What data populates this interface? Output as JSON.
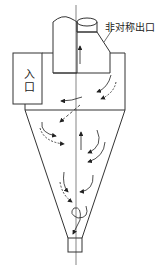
{
  "diagram": {
    "labels": {
      "inlet": "入口",
      "asymmetric_outlet": "非对称出口"
    },
    "components": [
      "inlet",
      "cylinder-body",
      "outlet-pipe",
      "asymmetric-outlet",
      "cone",
      "dust-outlet",
      "center-axis"
    ],
    "flow_arrows": [
      "inner-upward-flow",
      "outer-downward-vortex",
      "short-circuit-flow",
      "cone-vortex"
    ],
    "colors": {
      "stroke": "#333333",
      "background": "#ffffff"
    }
  }
}
